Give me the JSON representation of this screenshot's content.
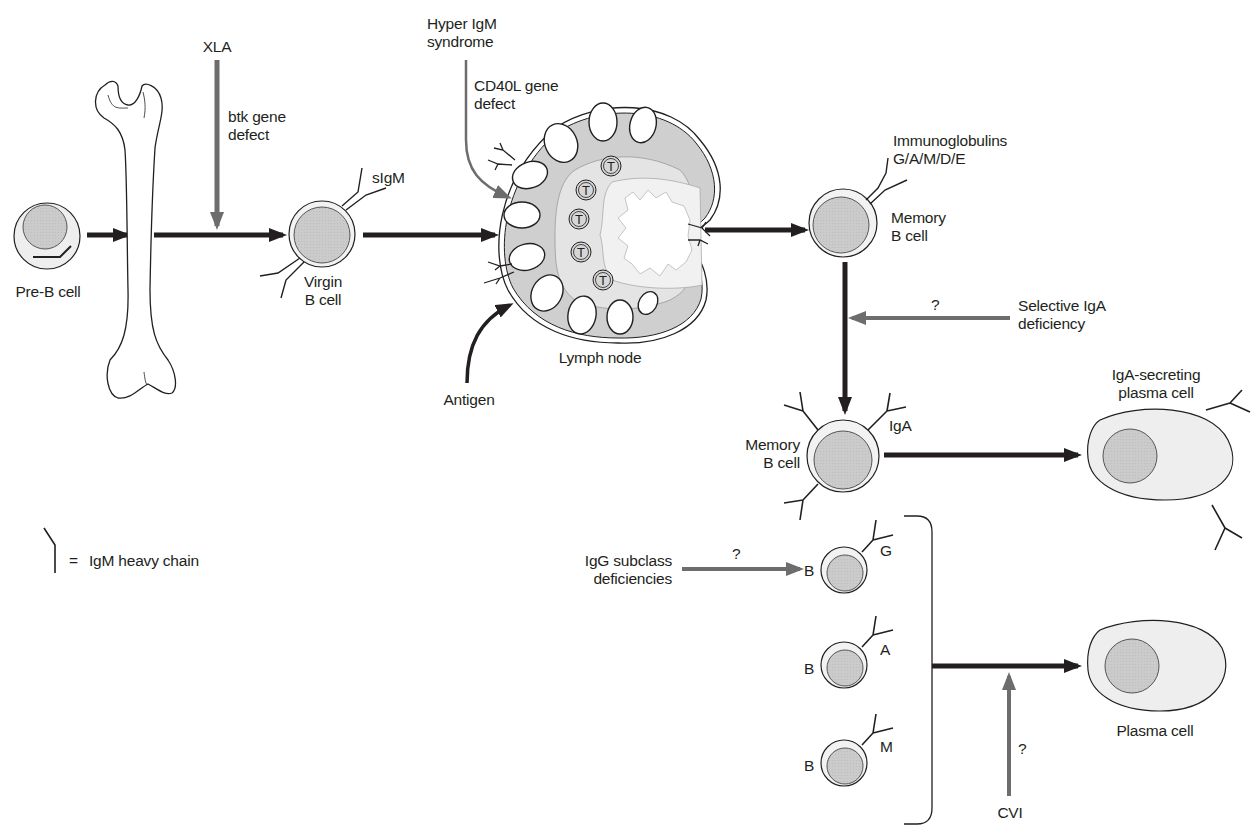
{
  "diagram": {
    "colors": {
      "ink": "#231f20",
      "defect_arrow": "#6d6d6d",
      "cytoplasm": "#eeeeee",
      "nucleus": "#c9c9c9",
      "lymph_outer": "#cfcfcf",
      "lymph_inner": "#e6e6e6",
      "medulla": "#f3f3f3"
    },
    "stages": {
      "pre_b": {
        "label": "Pre-B cell"
      },
      "virgin_b": {
        "label_line1": "Virgin",
        "label_line2": "B cell",
        "receptor": "sIgM"
      },
      "lymph_node": {
        "label": "Lymph node",
        "t_cell_marker": "T",
        "input": "Antigen"
      },
      "memory_b": {
        "label_line1": "Memory",
        "label_line2": "B cell",
        "receptor_line1": "Immunoglobulins",
        "receptor_line2": "G/A/M/D/E"
      },
      "memory_b_iga": {
        "label_line1": "Memory",
        "label_line2": "B cell",
        "receptor": "IgA"
      },
      "iga_plasma": {
        "label_line1": "IgA-secreting",
        "label_line2": "plasma cell"
      },
      "b_subclasses": [
        {
          "cell": "B",
          "isotype": "G"
        },
        {
          "cell": "B",
          "isotype": "A"
        },
        {
          "cell": "B",
          "isotype": "M"
        }
      ],
      "plasma": {
        "label": "Plasma cell"
      }
    },
    "defects": {
      "xla": {
        "name": "XLA",
        "detail_line1": "btk gene",
        "detail_line2": "defect"
      },
      "hyper_igm": {
        "name_line1": "Hyper IgM",
        "name_line2": "syndrome",
        "detail_line1": "CD40L gene",
        "detail_line2": "defect"
      },
      "selective_iga": {
        "name_line1": "Selective IgA",
        "name_line2": "deficiency",
        "marker": "?"
      },
      "igg_subclass": {
        "name_line1": "IgG subclass",
        "name_line2": "deficiencies",
        "marker": "?"
      },
      "cvi": {
        "name": "CVI",
        "marker": "?"
      }
    },
    "legend": {
      "equals": "=",
      "text": "IgM heavy chain"
    }
  }
}
